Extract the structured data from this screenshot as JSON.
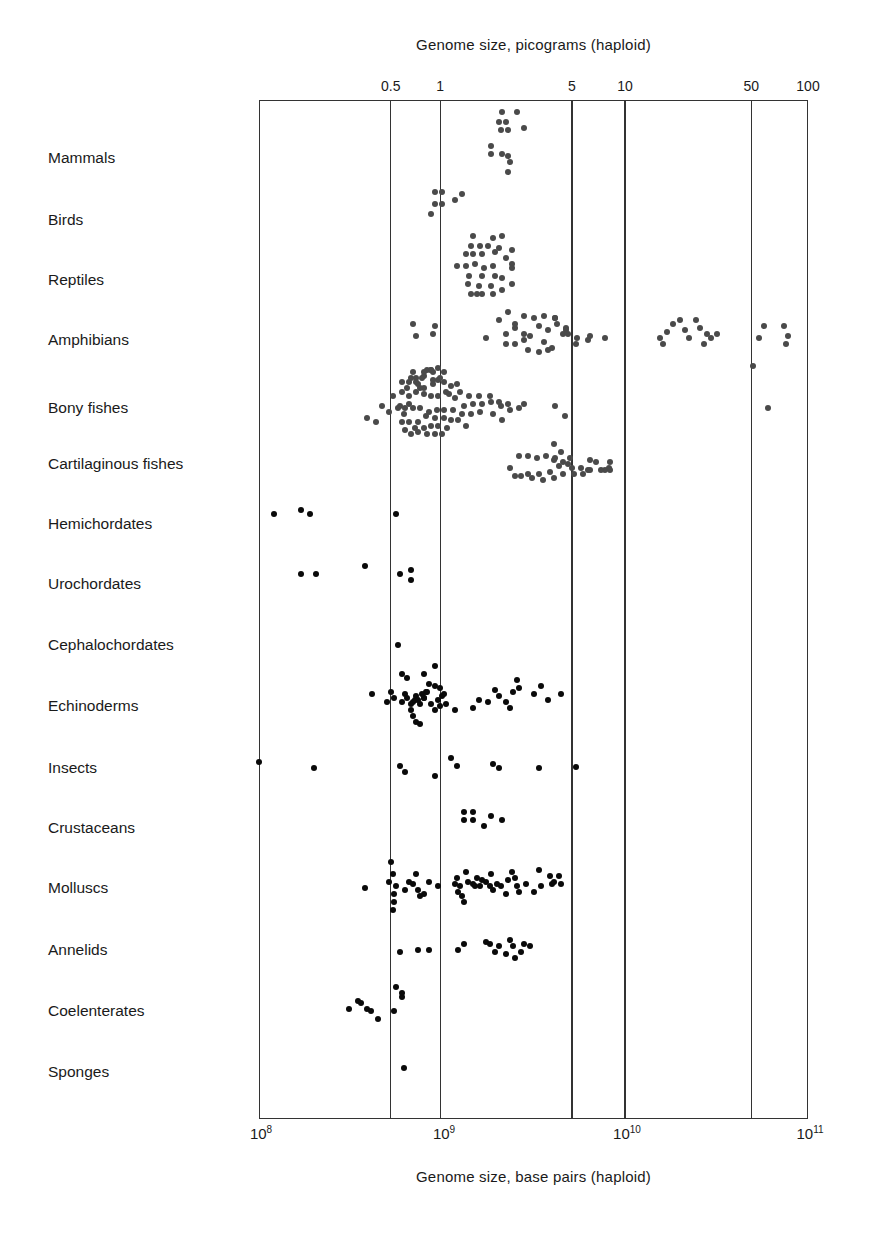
{
  "chart_data": {
    "type": "scatter",
    "title_top": "Genome size, picograms (haploid)",
    "xlabel": "Genome size, base pairs (haploid)",
    "x_scale": "log10",
    "xlim_bp": [
      100000000,
      100000000000
    ],
    "bottom_ticks": [
      {
        "base": "10",
        "exp": "8",
        "log": 8
      },
      {
        "base": "10",
        "exp": "9",
        "log": 9
      },
      {
        "base": "10",
        "exp": "10",
        "log": 10
      },
      {
        "base": "10",
        "exp": "11",
        "log": 11
      }
    ],
    "top_ticks": [
      {
        "label": "0.5",
        "log": 8.72
      },
      {
        "label": "1",
        "log": 8.99
      },
      {
        "label": "5",
        "log": 9.71
      },
      {
        "label": "10",
        "log": 10.0
      },
      {
        "label": "50",
        "log": 10.69
      },
      {
        "label": "100",
        "log": 11.0
      }
    ],
    "grid_vertical_at_log": [
      8.72,
      8.99,
      9.71,
      10.0,
      10.69
    ],
    "categories": [
      "Mammals",
      "Birds",
      "Reptiles",
      "Amphibians",
      "Bony fishes",
      "Cartilaginous fishes",
      "Hemichordates",
      "Urochordates",
      "Cephalochordates",
      "Echinoderms",
      "Insects",
      "Crustaceans",
      "Molluscs",
      "Annelids",
      "Coelenterates",
      "Sponges"
    ],
    "row_y": [
      158,
      220,
      280,
      340,
      408,
      464,
      524,
      584,
      645,
      706,
      768,
      828,
      888,
      950,
      1011,
      1072
    ],
    "series": [
      {
        "name": "Mammals",
        "color": "grey",
        "points_log_bp": [
          9.33,
          9.41,
          9.31,
          9.35,
          9.32,
          9.36,
          9.45,
          9.27,
          9.27,
          9.33,
          9.36,
          9.37,
          9.36
        ],
        "dy": [
          -46,
          -46,
          -36,
          -36,
          -28,
          -28,
          -30,
          -12,
          -4,
          -4,
          -2,
          4,
          14
        ]
      },
      {
        "name": "Birds",
        "color": "grey",
        "points_log_bp": [
          8.96,
          9.0,
          9.07,
          9.11,
          8.96,
          9.0,
          8.94
        ],
        "dy": [
          -28,
          -28,
          -20,
          -26,
          -16,
          -16,
          -6
        ]
      },
      {
        "name": "Reptiles",
        "color": "grey",
        "points_log_bp": [
          9.17,
          9.28,
          9.33,
          9.16,
          9.21,
          9.25,
          9.31,
          9.38,
          9.13,
          9.17,
          9.22,
          9.29,
          9.35,
          9.38,
          9.08,
          9.13,
          9.18,
          9.23,
          9.28,
          9.38,
          9.15,
          9.22,
          9.29,
          9.33,
          9.38,
          9.14,
          9.2,
          9.27,
          9.33,
          9.16,
          9.22,
          9.28,
          9.19
        ],
        "dy": [
          -44,
          -42,
          -44,
          -34,
          -34,
          -34,
          -32,
          -30,
          -26,
          -26,
          -26,
          -28,
          -22,
          -16,
          -14,
          -14,
          -16,
          -12,
          -14,
          -12,
          -4,
          -4,
          -4,
          -2,
          4,
          4,
          6,
          6,
          10,
          14,
          14,
          14,
          14
        ]
      },
      {
        "name": "Amphibians",
        "color": "grey",
        "points_log_bp": [
          8.84,
          8.86,
          8.96,
          8.95,
          9.24,
          9.31,
          9.36,
          9.35,
          9.4,
          9.45,
          9.5,
          9.53,
          9.58,
          9.62,
          9.63,
          9.66,
          9.68,
          9.35,
          9.4,
          9.45,
          9.48,
          9.56,
          9.6,
          9.69,
          9.73,
          9.8,
          9.4,
          9.45,
          9.56,
          9.62,
          9.68,
          9.74,
          9.81,
          9.89,
          9.47,
          9.53,
          9.58,
          10.19,
          10.21,
          10.23,
          10.26,
          10.3,
          10.33,
          10.35,
          10.39,
          10.41,
          10.43,
          10.45,
          10.47,
          10.5,
          10.73,
          10.76,
          10.87,
          10.89,
          10.88
        ],
        "dy": [
          -16,
          -4,
          -14,
          -6,
          -2,
          -20,
          -28,
          -6,
          -12,
          -6,
          -22,
          -14,
          -10,
          -22,
          -16,
          -6,
          -12,
          4,
          4,
          0,
          -4,
          2,
          8,
          -6,
          4,
          0,
          -16,
          -24,
          -24,
          -22,
          -10,
          -2,
          -4,
          -2,
          10,
          12,
          10,
          -2,
          4,
          -8,
          -16,
          -20,
          -10,
          -2,
          -20,
          -12,
          4,
          -6,
          -2,
          -6,
          -2,
          -14,
          -14,
          -4,
          4
        ]
      },
      {
        "name": "Bony fishes",
        "color": "grey",
        "points_log_bp": [
          8.59,
          8.64,
          8.67,
          8.71,
          8.77,
          8.79,
          8.81,
          8.82,
          8.86,
          8.87,
          8.9,
          8.92,
          8.95,
          8.98,
          9.01,
          9.05,
          9.1,
          9.15,
          9.2,
          9.26,
          9.32,
          9.37,
          9.42,
          9.62,
          9.67,
          8.73,
          8.78,
          8.82,
          8.86,
          8.9,
          8.94,
          8.98,
          9.02,
          9.07,
          9.12,
          9.17,
          9.22,
          9.27,
          9.31,
          9.36,
          9.45,
          8.76,
          8.8,
          8.84,
          8.88,
          8.93,
          8.97,
          9.01,
          9.06,
          9.11,
          9.16,
          9.21,
          9.28,
          9.33,
          8.78,
          8.82,
          8.87,
          8.91,
          8.96,
          9.01,
          9.05,
          9.09,
          9.13,
          8.8,
          8.85,
          8.9,
          8.94,
          8.98,
          9.03,
          8.83,
          8.87,
          8.92,
          8.96,
          9.0,
          8.88,
          8.9,
          8.95,
          8.78,
          8.82,
          8.86,
          8.95,
          8.99,
          9.04,
          9.08,
          8.83,
          8.89,
          8.94,
          8.98,
          9.01,
          8.84,
          8.9,
          8.94,
          10.7,
          10.78
        ],
        "dy": [
          10,
          14,
          -2,
          4,
          -2,
          6,
          -20,
          -4,
          -30,
          -24,
          -32,
          -38,
          -28,
          -28,
          -26,
          -22,
          -16,
          -12,
          -12,
          -12,
          -2,
          2,
          0,
          -2,
          8,
          -12,
          -16,
          -12,
          -16,
          -20,
          -12,
          -12,
          -16,
          -10,
          -2,
          -4,
          -4,
          -6,
          -6,
          -4,
          -4,
          0,
          0,
          0,
          0,
          4,
          2,
          2,
          2,
          6,
          6,
          4,
          6,
          12,
          14,
          14,
          14,
          8,
          10,
          10,
          12,
          12,
          18,
          22,
          20,
          20,
          18,
          18,
          20,
          26,
          24,
          26,
          26,
          26,
          -20,
          -14,
          -24,
          -26,
          -26,
          -26,
          -36,
          -30,
          -14,
          -24,
          -30,
          -30,
          -38,
          -40,
          -36,
          -36,
          -36,
          -38,
          -42,
          0,
          8
        ]
      },
      {
        "name": "Cartilaginous fishes",
        "color": "grey",
        "points_log_bp": [
          9.37,
          9.42,
          9.47,
          9.52,
          9.57,
          9.61,
          9.65,
          9.7,
          9.4,
          9.47,
          9.53,
          9.59,
          9.64,
          9.69,
          9.43,
          9.49,
          9.55,
          9.61,
          9.66,
          9.72,
          9.77,
          9.84,
          9.89,
          9.8,
          9.87,
          9.91
        ],
        "dy": [
          4,
          -8,
          -8,
          -6,
          -8,
          -4,
          -12,
          -6,
          12,
          10,
          10,
          8,
          2,
          0,
          12,
          14,
          16,
          14,
          10,
          10,
          10,
          -2,
          6,
          6,
          6,
          4
        ],
        "extra": {
          "points_log_bp": [
            9.61,
            9.62,
            9.66,
            9.71,
            9.76,
            9.81,
            9.81,
            9.92,
            9.92
          ],
          "dy": [
            -20,
            -6,
            -2,
            4,
            4,
            -4,
            6,
            6,
            -2
          ]
        }
      },
      {
        "name": "Hemichordates",
        "color": "black",
        "points_log_bp": [
          8.08,
          8.23,
          8.28,
          8.75
        ],
        "dy": [
          -10,
          -14,
          -10,
          -10
        ]
      },
      {
        "name": "Urochordates",
        "color": "black",
        "points_log_bp": [
          8.23,
          8.31,
          8.58,
          8.77,
          8.83,
          8.83
        ],
        "dy": [
          -10,
          -10,
          -18,
          -10,
          -14,
          -4
        ]
      },
      {
        "name": "Cephalochordates",
        "color": "black",
        "points_log_bp": [
          8.76
        ],
        "dy": [
          0
        ]
      },
      {
        "name": "Echinoderms",
        "color": "black",
        "points_log_bp": [
          8.62,
          8.7,
          8.72,
          8.74,
          8.78,
          8.8,
          8.81,
          8.83,
          8.84,
          8.85,
          8.86,
          8.87,
          8.88,
          8.89,
          8.9,
          8.91,
          8.92,
          8.94,
          8.96,
          8.98,
          8.99,
          9.0,
          9.02,
          9.07,
          9.17,
          9.2,
          9.25,
          9.29,
          9.31,
          9.35,
          9.37,
          9.39,
          9.41,
          9.42,
          9.5,
          9.54,
          9.58,
          9.65
        ],
        "dy": [
          -12,
          -4,
          -14,
          -8,
          -4,
          -12,
          -8,
          -2,
          -4,
          -6,
          -10,
          -6,
          -2,
          -12,
          -8,
          -14,
          -14,
          -2,
          4,
          -6,
          0,
          -10,
          -2,
          4,
          2,
          -6,
          -4,
          -16,
          -10,
          -4,
          2,
          -14,
          -26,
          -18,
          -12,
          -20,
          -6,
          -12
        ],
        "extra": {
          "points_log_bp": [
            8.78,
            8.81,
            8.83,
            8.84,
            8.86,
            8.88,
            8.9,
            8.93,
            8.96,
            8.99,
            9.01,
            8.9,
            8.96
          ],
          "dy": [
            -32,
            -28,
            4,
            10,
            16,
            18,
            -8,
            -22,
            -20,
            -18,
            -12,
            -32,
            -40
          ]
        }
      },
      {
        "name": "Insects",
        "color": "black",
        "points_log_bp": [
          8.0,
          8.3,
          8.77,
          8.8,
          8.96,
          9.05,
          9.08,
          9.28,
          9.31,
          9.53,
          9.73
        ],
        "dy": [
          -6,
          0,
          -2,
          4,
          8,
          -10,
          -2,
          -4,
          0,
          0,
          -1
        ]
      },
      {
        "name": "Crustaceans",
        "color": "black",
        "points_log_bp": [
          9.12,
          9.17,
          9.12,
          9.17,
          9.23,
          9.33,
          9.27
        ],
        "dy": [
          -16,
          -16,
          -8,
          -8,
          -2,
          -8,
          -12
        ]
      },
      {
        "name": "Molluscs",
        "color": "black",
        "points_log_bp": [
          8.58,
          8.71,
          8.72,
          8.73,
          8.74,
          8.75,
          8.74,
          8.73,
          8.8,
          8.82,
          8.84,
          8.86,
          8.87,
          8.88,
          8.9,
          8.93,
          8.98,
          9.07,
          9.08,
          9.09,
          9.1,
          9.11,
          9.12,
          9.13,
          9.14,
          9.17,
          9.18,
          9.19,
          9.21,
          9.22,
          9.24,
          9.26,
          9.27,
          9.28,
          9.3,
          9.32,
          9.35,
          9.36,
          9.38,
          9.4,
          9.41,
          9.42,
          9.46,
          9.5,
          9.53,
          9.54,
          9.59,
          9.6,
          9.61,
          9.64,
          9.65
        ],
        "dy": [
          0,
          -6,
          -26,
          -14,
          14,
          -2,
          6,
          22,
          2,
          -6,
          -4,
          -14,
          2,
          8,
          6,
          -6,
          -2,
          -4,
          -10,
          4,
          -2,
          8,
          14,
          -16,
          -6,
          -4,
          -2,
          -10,
          -2,
          -8,
          -6,
          -2,
          -14,
          2,
          -4,
          -2,
          6,
          -8,
          -16,
          -10,
          -2,
          4,
          -4,
          4,
          -18,
          -2,
          -12,
          -4,
          -6,
          -12,
          -4
        ]
      },
      {
        "name": "Annelids",
        "color": "black",
        "points_log_bp": [
          8.77,
          8.87,
          8.93,
          9.09,
          9.12,
          9.24,
          9.26,
          9.29,
          9.31,
          9.35,
          9.37,
          9.39,
          9.4,
          9.43,
          9.45,
          9.48
        ],
        "dy": [
          2,
          0,
          0,
          0,
          -6,
          -8,
          -6,
          2,
          -4,
          4,
          -10,
          -4,
          8,
          2,
          -6,
          -4
        ]
      },
      {
        "name": "Coelenterates",
        "color": "black",
        "points_log_bp": [
          8.49,
          8.54,
          8.56,
          8.59,
          8.61,
          8.65,
          8.75,
          8.78,
          8.74,
          8.78
        ],
        "dy": [
          -2,
          -10,
          -8,
          -2,
          0,
          8,
          -24,
          -14,
          0,
          -18
        ]
      },
      {
        "name": "Sponges",
        "color": "black",
        "points_log_bp": [
          8.79
        ],
        "dy": [
          -4
        ]
      }
    ]
  },
  "layout": {
    "plot_left_px": 259,
    "plot_right_px": 808,
    "px_per_decade": 183
  }
}
